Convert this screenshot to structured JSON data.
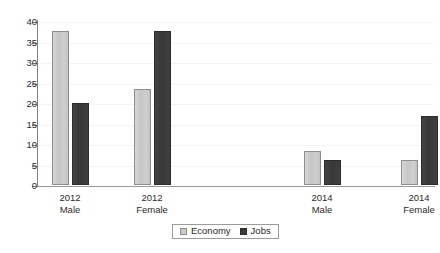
{
  "chart_data": {
    "type": "bar",
    "title": "",
    "xlabel": "",
    "ylabel": "",
    "ylim": [
      0,
      40
    ],
    "ytick_step": 5,
    "yticks": [
      0,
      5,
      10,
      15,
      20,
      25,
      30,
      35,
      40
    ],
    "ytick_labels": [
      "0",
      "5",
      "10",
      "15",
      "20",
      "25",
      "30",
      "35",
      "40"
    ],
    "grid": true,
    "legend_position": "bottom-center",
    "categories": [
      "2012 Male",
      "2012 Female",
      "2014 Male",
      "2014 Female"
    ],
    "category_lines": [
      {
        "line1": "2012",
        "line2": "Male"
      },
      {
        "line1": "2012",
        "line2": "Female"
      },
      {
        "line1": "2014",
        "line2": "Male"
      },
      {
        "line1": "2014",
        "line2": "Female"
      }
    ],
    "series": [
      {
        "name": "Economy",
        "color": "#c9c9c9",
        "values": [
          37.5,
          23.5,
          8.2,
          6.2
        ]
      },
      {
        "name": "Jobs",
        "color": "#3b3b3b",
        "values": [
          20.0,
          37.5,
          6.1,
          16.8
        ]
      }
    ]
  },
  "legend": {
    "items": [
      {
        "label": "Economy",
        "swatch": "economy"
      },
      {
        "label": "Jobs",
        "swatch": "jobs"
      }
    ]
  },
  "colors": {
    "economy": "#c9c9c9",
    "economy_border": "#8e8e8e",
    "jobs": "#3b3b3b",
    "jobs_border": "#2c2c2c",
    "axis": "#808080",
    "gridline": "#f4f4f4",
    "text": "#2b2b2b",
    "background": "#ffffff"
  },
  "layout": {
    "group_centers_px": [
      70,
      152,
      322,
      419
    ],
    "bar_width_px": 17,
    "bar_gap_px": 3,
    "plot_left_px": 37,
    "plot_top_px": 22,
    "plot_width_px": 398,
    "plot_height_px": 164
  }
}
